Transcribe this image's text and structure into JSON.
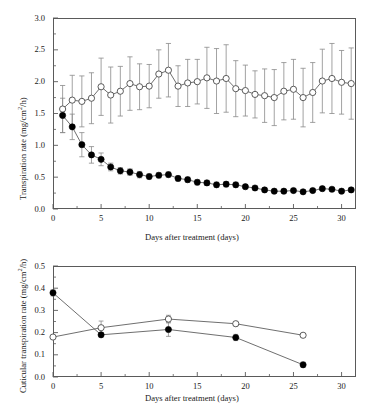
{
  "figure": {
    "panels": [
      "top-transpiration-panel",
      "bottom-cuticular-panel"
    ]
  },
  "top_panel": {
    "y_axis_title_pre": "Transpiration rate (mg/cm",
    "y_axis_title_sup": "2",
    "y_axis_title_post": "/h)",
    "x_axis_title": "Days after treatment (days)",
    "y_ticks": [
      "0.0",
      "0.5",
      "1.0",
      "1.5",
      "2.0",
      "2.5",
      "3.0"
    ],
    "x_ticks": [
      "0",
      "5",
      "10",
      "15",
      "20",
      "25",
      "30"
    ]
  },
  "bottom_panel": {
    "y_axis_title_pre": "Cuticular transpiration rate (mg/cm",
    "y_axis_title_sup": "2",
    "y_axis_title_post": "/h)",
    "x_axis_title": "Days after treatment (days)",
    "y_ticks": [
      "0.0",
      "0.1",
      "0.2",
      "0.3",
      "0.4",
      "0.5"
    ],
    "x_ticks": [
      "0",
      "5",
      "10",
      "15",
      "20",
      "25",
      "30"
    ]
  },
  "chart_data": [
    {
      "type": "line",
      "id": "top-transpiration-panel",
      "title": "",
      "xlabel": "Days after treatment (days)",
      "ylabel": "Transpiration rate (mg/cm2/h)",
      "xlim": [
        0,
        31.5
      ],
      "ylim": [
        0.0,
        3.0
      ],
      "xticks": [
        0,
        5,
        10,
        15,
        20,
        25,
        30
      ],
      "yticks": [
        0.0,
        0.5,
        1.0,
        1.5,
        2.0,
        2.5,
        3.0
      ],
      "grid": false,
      "legend": "none",
      "error_bars": "symmetric standard deviation",
      "x": [
        1,
        2,
        3,
        4,
        5,
        6,
        7,
        8,
        9,
        10,
        11,
        12,
        13,
        14,
        15,
        16,
        17,
        18,
        19,
        20,
        21,
        22,
        23,
        24,
        25,
        26,
        27,
        28,
        29,
        30,
        31
      ],
      "series": [
        {
          "name": "open-circle-control",
          "marker": "open-circle",
          "values": [
            1.57,
            1.71,
            1.69,
            1.74,
            1.92,
            1.79,
            1.85,
            1.97,
            1.92,
            1.93,
            2.12,
            2.18,
            1.93,
            1.98,
            2.0,
            2.06,
            2.01,
            2.05,
            1.89,
            1.86,
            1.8,
            1.78,
            1.75,
            1.85,
            1.88,
            1.75,
            1.83,
            2.01,
            2.05,
            1.99,
            1.97
          ],
          "errors": [
            0.37,
            0.39,
            0.4,
            0.4,
            0.45,
            0.44,
            0.39,
            0.42,
            0.36,
            0.34,
            0.38,
            0.42,
            0.32,
            0.37,
            0.35,
            0.48,
            0.51,
            0.53,
            0.44,
            0.4,
            0.37,
            0.42,
            0.44,
            0.45,
            0.47,
            0.46,
            0.47,
            0.5,
            0.55,
            0.5,
            0.56
          ]
        },
        {
          "name": "filled-circle-treatment",
          "marker": "filled-circle",
          "values": [
            1.47,
            1.29,
            1.01,
            0.85,
            0.78,
            0.66,
            0.6,
            0.58,
            0.54,
            0.51,
            0.53,
            0.54,
            0.48,
            0.46,
            0.42,
            0.41,
            0.38,
            0.39,
            0.38,
            0.35,
            0.33,
            0.3,
            0.28,
            0.28,
            0.29,
            0.27,
            0.29,
            0.32,
            0.31,
            0.28,
            0.3
          ],
          "errors": [
            0.27,
            0.2,
            0.19,
            0.13,
            0.1,
            0.06,
            0.05,
            0.05,
            0.05,
            0.04,
            0.04,
            0.04,
            0.04,
            0.04,
            0.04,
            0.04,
            0.04,
            0.04,
            0.04,
            0.03,
            0.03,
            0.03,
            0.03,
            0.03,
            0.03,
            0.03,
            0.03,
            0.03,
            0.03,
            0.03,
            0.03
          ]
        }
      ]
    },
    {
      "type": "line",
      "id": "bottom-cuticular-panel",
      "title": "",
      "xlabel": "Days after treatment (days)",
      "ylabel": "Cuticular transpiration rate (mg/cm2/h)",
      "xlim": [
        0,
        31.5
      ],
      "ylim": [
        0.0,
        0.5
      ],
      "xticks": [
        0,
        5,
        10,
        15,
        20,
        25,
        30
      ],
      "yticks": [
        0.0,
        0.1,
        0.2,
        0.3,
        0.4,
        0.5
      ],
      "grid": false,
      "legend": "none",
      "error_bars": "symmetric standard deviation",
      "x": [
        0,
        5,
        12,
        19,
        26
      ],
      "series": [
        {
          "name": "open-circle-control",
          "marker": "open-circle",
          "values": [
            0.18,
            0.222,
            0.261,
            0.24,
            0.188
          ],
          "errors": [
            0.006,
            0.03,
            0.017,
            0.01,
            0.008
          ]
        },
        {
          "name": "filled-circle-treatment",
          "marker": "filled-circle",
          "values": [
            0.379,
            0.19,
            0.214,
            0.178,
            0.055
          ],
          "errors": [
            0.014,
            0.01,
            0.031,
            0.014,
            0.012
          ]
        }
      ]
    }
  ]
}
